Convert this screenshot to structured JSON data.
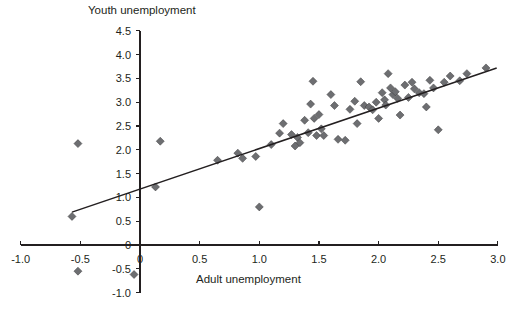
{
  "chart_data": {
    "type": "scatter",
    "title": "",
    "ylabel": "Youth unemployment",
    "xlabel": "Adult unemployment",
    "xlim": [
      -1.0,
      3.0
    ],
    "ylim": [
      -1.0,
      4.5
    ],
    "xticks": [
      "-1.0",
      "-0.5",
      "0",
      "0.5",
      "1.0",
      "1.5",
      "2.0",
      "2.5",
      "3.0"
    ],
    "xtick_values": [
      -1.0,
      -0.5,
      0,
      0.5,
      1.0,
      1.5,
      2.0,
      2.5,
      3.0
    ],
    "yticks": [
      "-1.0",
      "-0.5",
      "0",
      "0.5",
      "1.0",
      "1.5",
      "2.0",
      "2.5",
      "3.0",
      "3.5",
      "4.0",
      "4.5"
    ],
    "ytick_values": [
      -1.0,
      -0.5,
      0,
      0.5,
      1.0,
      1.5,
      2.0,
      2.5,
      3.0,
      3.5,
      4.0,
      4.5
    ],
    "grid": false,
    "legend": "none",
    "marker": "diamond",
    "marker_color": "#6d6e71",
    "line_color": "#231f20",
    "trendline": {
      "type": "linear",
      "x_start": -0.57,
      "y_start": 0.69,
      "x_end": 2.99,
      "y_end": 3.72,
      "slope": 0.852,
      "intercept": 1.176
    },
    "points": [
      [
        -0.57,
        0.6
      ],
      [
        -0.52,
        2.13
      ],
      [
        -0.52,
        -0.55
      ],
      [
        -0.05,
        -0.62
      ],
      [
        0.13,
        1.22
      ],
      [
        0.17,
        2.18
      ],
      [
        0.65,
        1.78
      ],
      [
        0.82,
        1.93
      ],
      [
        0.86,
        1.82
      ],
      [
        0.97,
        1.86
      ],
      [
        1.0,
        0.8
      ],
      [
        1.1,
        2.11
      ],
      [
        1.17,
        2.35
      ],
      [
        1.2,
        2.55
      ],
      [
        1.27,
        2.32
      ],
      [
        1.3,
        2.08
      ],
      [
        1.32,
        2.26
      ],
      [
        1.34,
        2.15
      ],
      [
        1.38,
        2.62
      ],
      [
        1.41,
        2.36
      ],
      [
        1.43,
        2.96
      ],
      [
        1.45,
        3.44
      ],
      [
        1.46,
        2.66
      ],
      [
        1.48,
        2.3
      ],
      [
        1.5,
        2.74
      ],
      [
        1.52,
        2.44
      ],
      [
        1.54,
        2.3
      ],
      [
        1.6,
        3.16
      ],
      [
        1.63,
        2.93
      ],
      [
        1.66,
        2.22
      ],
      [
        1.72,
        2.2
      ],
      [
        1.76,
        2.85
      ],
      [
        1.8,
        3.02
      ],
      [
        1.82,
        2.55
      ],
      [
        1.85,
        3.43
      ],
      [
        1.88,
        2.93
      ],
      [
        1.92,
        2.9
      ],
      [
        1.95,
        2.84
      ],
      [
        1.98,
        3.0
      ],
      [
        2.0,
        2.66
      ],
      [
        2.03,
        3.2
      ],
      [
        2.05,
        3.05
      ],
      [
        2.06,
        2.94
      ],
      [
        2.08,
        3.6
      ],
      [
        2.1,
        3.3
      ],
      [
        2.12,
        3.16
      ],
      [
        2.14,
        3.22
      ],
      [
        2.16,
        3.08
      ],
      [
        2.18,
        2.73
      ],
      [
        2.22,
        3.36
      ],
      [
        2.25,
        3.1
      ],
      [
        2.28,
        3.42
      ],
      [
        2.3,
        3.28
      ],
      [
        2.34,
        3.2
      ],
      [
        2.38,
        3.18
      ],
      [
        2.4,
        2.9
      ],
      [
        2.43,
        3.46
      ],
      [
        2.46,
        3.3
      ],
      [
        2.5,
        2.42
      ],
      [
        2.55,
        3.42
      ],
      [
        2.6,
        3.55
      ],
      [
        2.68,
        3.45
      ],
      [
        2.74,
        3.6
      ],
      [
        2.9,
        3.72
      ]
    ]
  }
}
